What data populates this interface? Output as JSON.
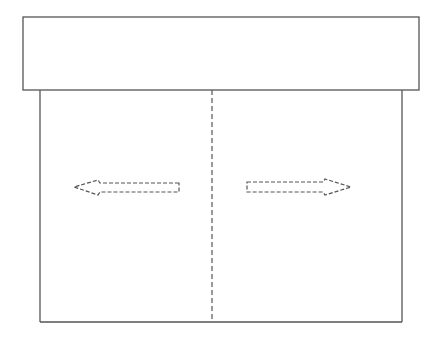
{
  "diagram": {
    "colors": {
      "stroke": "#555555",
      "background": "#ffffff"
    },
    "header_box": {
      "x": 23,
      "y": 17,
      "width": 396,
      "height": 73
    },
    "frame": {
      "left": 40,
      "right": 402,
      "top": 90,
      "bottom": 322
    },
    "center_divider": {
      "x": 212,
      "style": "dashed"
    },
    "arrows": [
      {
        "name": "left-arrow",
        "direction": "left",
        "style": "dashed",
        "tip_x": 74,
        "y": 187
      },
      {
        "name": "right-arrow",
        "direction": "right",
        "style": "dashed",
        "tip_x": 351,
        "y": 187
      }
    ]
  }
}
